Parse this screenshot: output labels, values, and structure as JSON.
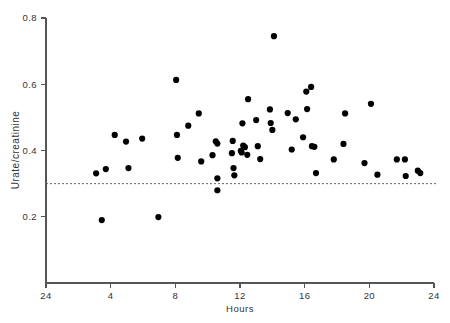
{
  "chart_data": {
    "type": "scatter",
    "title": "",
    "subtitle": "",
    "xlabel": "Hours",
    "ylabel": "Urate/creatinine",
    "xlim": [
      0,
      24
    ],
    "ylim": [
      0,
      0.8
    ],
    "xticks": [
      0,
      4,
      8,
      12,
      16,
      20,
      24
    ],
    "xtick_labels": [
      "24",
      "4",
      "8",
      "12",
      "16",
      "20",
      "24"
    ],
    "yticks": [
      0.2,
      0.4,
      0.6,
      0.8
    ],
    "ytick_labels": [
      "0.2",
      "0.4",
      "0.6",
      "0.8"
    ],
    "grid": false,
    "legend": null,
    "marker": "filled-circle",
    "marker_color": "#000000",
    "marker_size_px": 3.1,
    "annotations": [
      {
        "type": "horizontal-reference-line",
        "value": 0.3,
        "style": "dashed",
        "color": "#666666",
        "label": ""
      }
    ],
    "points": [
      {
        "x": 3.1,
        "y": 0.331
      },
      {
        "x": 3.45,
        "y": 0.19
      },
      {
        "x": 3.7,
        "y": 0.344
      },
      {
        "x": 4.25,
        "y": 0.447
      },
      {
        "x": 4.95,
        "y": 0.427
      },
      {
        "x": 5.1,
        "y": 0.347
      },
      {
        "x": 5.95,
        "y": 0.436
      },
      {
        "x": 6.95,
        "y": 0.199
      },
      {
        "x": 8.05,
        "y": 0.613
      },
      {
        "x": 8.1,
        "y": 0.447
      },
      {
        "x": 8.15,
        "y": 0.378
      },
      {
        "x": 8.8,
        "y": 0.475
      },
      {
        "x": 9.45,
        "y": 0.512
      },
      {
        "x": 9.6,
        "y": 0.367
      },
      {
        "x": 10.3,
        "y": 0.386
      },
      {
        "x": 10.5,
        "y": 0.428
      },
      {
        "x": 10.6,
        "y": 0.421
      },
      {
        "x": 10.6,
        "y": 0.316
      },
      {
        "x": 10.6,
        "y": 0.28
      },
      {
        "x": 11.5,
        "y": 0.392
      },
      {
        "x": 11.55,
        "y": 0.429
      },
      {
        "x": 11.6,
        "y": 0.347
      },
      {
        "x": 11.65,
        "y": 0.325
      },
      {
        "x": 12.05,
        "y": 0.399
      },
      {
        "x": 12.1,
        "y": 0.394
      },
      {
        "x": 12.15,
        "y": 0.482
      },
      {
        "x": 12.2,
        "y": 0.415
      },
      {
        "x": 12.3,
        "y": 0.41
      },
      {
        "x": 12.45,
        "y": 0.387
      },
      {
        "x": 12.5,
        "y": 0.555
      },
      {
        "x": 13.0,
        "y": 0.492
      },
      {
        "x": 13.1,
        "y": 0.413
      },
      {
        "x": 13.25,
        "y": 0.374
      },
      {
        "x": 13.85,
        "y": 0.524
      },
      {
        "x": 13.9,
        "y": 0.483
      },
      {
        "x": 14.0,
        "y": 0.462
      },
      {
        "x": 14.1,
        "y": 0.745
      },
      {
        "x": 14.95,
        "y": 0.513
      },
      {
        "x": 15.2,
        "y": 0.403
      },
      {
        "x": 15.45,
        "y": 0.494
      },
      {
        "x": 15.9,
        "y": 0.44
      },
      {
        "x": 16.1,
        "y": 0.578
      },
      {
        "x": 16.15,
        "y": 0.525
      },
      {
        "x": 16.4,
        "y": 0.592
      },
      {
        "x": 16.45,
        "y": 0.413
      },
      {
        "x": 16.6,
        "y": 0.411
      },
      {
        "x": 16.7,
        "y": 0.332
      },
      {
        "x": 17.8,
        "y": 0.373
      },
      {
        "x": 18.4,
        "y": 0.42
      },
      {
        "x": 18.5,
        "y": 0.512
      },
      {
        "x": 19.7,
        "y": 0.362
      },
      {
        "x": 20.1,
        "y": 0.541
      },
      {
        "x": 20.5,
        "y": 0.327
      },
      {
        "x": 21.7,
        "y": 0.373
      },
      {
        "x": 22.2,
        "y": 0.373
      },
      {
        "x": 22.25,
        "y": 0.323
      },
      {
        "x": 23.0,
        "y": 0.339
      },
      {
        "x": 23.15,
        "y": 0.332
      }
    ]
  },
  "figure": {
    "background_color": "#ffffff",
    "axis_color": "#555555",
    "text_color": "#333333"
  }
}
